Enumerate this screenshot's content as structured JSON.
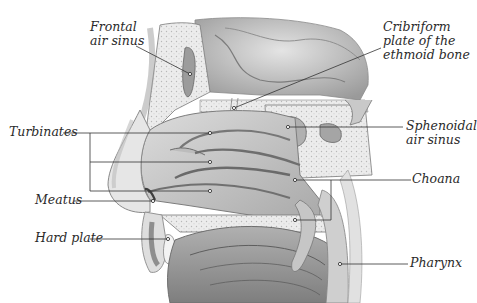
{
  "diagram": {
    "type": "anatomical cross-section",
    "labels": [
      {
        "id": "frontal",
        "text": "Frontal\nair sinus"
      },
      {
        "id": "cribriform",
        "text": "Cribriform\nplate of the\nethmoid bone"
      },
      {
        "id": "turbinates",
        "text": "Turbinates"
      },
      {
        "id": "sphenoidal",
        "text": "Sphenoidal\nair sinus"
      },
      {
        "id": "choana",
        "text": "Choana"
      },
      {
        "id": "meatus",
        "text": "Meatus"
      },
      {
        "id": "hard_plate",
        "text": "Hard plate"
      },
      {
        "id": "pharynx",
        "text": "Pharynx"
      }
    ],
    "colors": {
      "background": "#ffffff",
      "text": "#2a2a2a",
      "leader_line": "#333333",
      "tissue_light": "#d9d9d9",
      "tissue_mid": "#b5b5b5",
      "tissue_dark": "#8a8a8a",
      "bone_fill": "#e8e8e8"
    }
  }
}
